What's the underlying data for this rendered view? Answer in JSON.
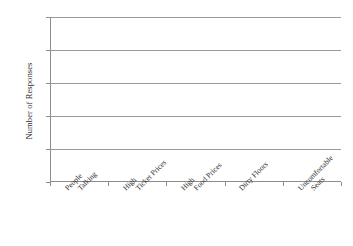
{
  "chart_data": {
    "type": "bar",
    "title": "",
    "subtitle": "",
    "xlabel": "",
    "ylabel": "Number of Responses",
    "categories": [
      "People Talking",
      "High Ticket Prices",
      "High Food Prices",
      "Dirty Floors",
      "Uncomfortable Seats"
    ],
    "category_lines": [
      [
        "People",
        "Talking"
      ],
      [
        "High",
        "Ticket Prices"
      ],
      [
        "High",
        "Food Prices"
      ],
      [
        "Dirty Floors",
        ""
      ],
      [
        "Uncomfortable",
        "Seats"
      ]
    ],
    "values": [
      0,
      0,
      0,
      0,
      0
    ],
    "ylim": [
      0,
      25
    ],
    "ytick_step": 5,
    "yticks": [
      0,
      5,
      10,
      15,
      20,
      25
    ],
    "ytick_labels": [
      "0",
      "5",
      "10",
      "15",
      "20",
      "25"
    ],
    "grid": true,
    "grid_axis": "y",
    "legend": false,
    "legend_position": "none",
    "note": "empty bar chart template; no bars are drawn, all category values are zero"
  },
  "colors": {
    "background": "#ffffff",
    "axis": "#8c8c8c",
    "gridline": "#9a9a9a",
    "text": "#2e2e2e",
    "bar": "#6f6f6f"
  }
}
